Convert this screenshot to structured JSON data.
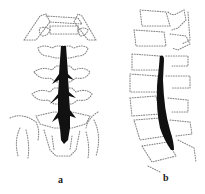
{
  "figure": {
    "panels": [
      {
        "id": "a",
        "label": "a",
        "view": "frontal (AP) view of lumbar spine with contrast column"
      },
      {
        "id": "b",
        "label": "b",
        "view": "lateral view of lumbar spine with contrast column"
      }
    ],
    "colors": {
      "outline": "#8a8a8a",
      "contrast": "#111111",
      "background": "#ffffff"
    }
  }
}
